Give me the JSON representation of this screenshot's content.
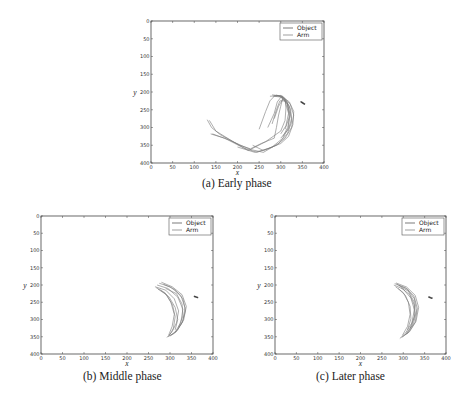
{
  "figure": {
    "panels": [
      {
        "id": "a",
        "caption": "(a) Early phase"
      },
      {
        "id": "b",
        "caption": "(b) Middle phase"
      },
      {
        "id": "c",
        "caption": "(c) Later phase"
      }
    ]
  },
  "colors": {
    "object": "#444444",
    "arm": "#777777",
    "axis": "#444444",
    "background": "#ffffff"
  },
  "chart_data": [
    {
      "type": "line",
      "title": "(a) Early phase",
      "xlabel": "x",
      "ylabel": "y",
      "xlim": [
        0,
        400
      ],
      "ylim": [
        400,
        0
      ],
      "y_inverted": true,
      "xticks": [
        0,
        50,
        100,
        150,
        200,
        250,
        300,
        350,
        400
      ],
      "yticks": [
        0,
        50,
        100,
        150,
        200,
        250,
        300,
        350,
        400
      ],
      "grid": false,
      "legend": {
        "position": "upper right",
        "entries": [
          "Object",
          "Arm"
        ]
      },
      "series": [
        {
          "name": "Object",
          "points": [
            [
              347,
              228
            ],
            [
              352,
              232
            ],
            [
              356,
              235
            ],
            [
              350,
              230
            ]
          ]
        },
        {
          "name": "Arm",
          "trajectories": [
            [
              [
                130,
                278
              ],
              [
                140,
                300
              ],
              [
                160,
                320
              ],
              [
                205,
                350
              ],
              [
                230,
                360
              ],
              [
                255,
                345
              ],
              [
                285,
                330
              ],
              [
                290,
                300
              ],
              [
                295,
                265
              ],
              [
                300,
                240
              ],
              [
                305,
                215
              ],
              [
                295,
                210
              ],
              [
                275,
                212
              ]
            ],
            [
              [
                135,
                280
              ],
              [
                150,
                310
              ],
              [
                190,
                340
              ],
              [
                225,
                365
              ],
              [
                265,
                340
              ],
              [
                300,
                310
              ],
              [
                310,
                280
              ],
              [
                312,
                245
              ],
              [
                310,
                220
              ],
              [
                300,
                210
              ],
              [
                282,
                212
              ]
            ],
            [
              [
                138,
                318
              ],
              [
                170,
                330
              ],
              [
                215,
                358
              ],
              [
                245,
                370
              ],
              [
                280,
                355
              ],
              [
                305,
                330
              ],
              [
                318,
                300
              ],
              [
                320,
                260
              ],
              [
                315,
                230
              ],
              [
                300,
                212
              ],
              [
                285,
                210
              ]
            ],
            [
              [
                142,
                318
              ],
              [
                180,
                335
              ],
              [
                230,
                362
              ],
              [
                260,
                370
              ],
              [
                295,
                345
              ],
              [
                315,
                318
              ],
              [
                325,
                285
              ],
              [
                323,
                250
              ],
              [
                312,
                222
              ],
              [
                290,
                208
              ]
            ],
            [
              [
                200,
                355
              ],
              [
                240,
                370
              ],
              [
                270,
                360
              ],
              [
                300,
                345
              ],
              [
                318,
                325
              ],
              [
                328,
                292
              ],
              [
                330,
                255
              ],
              [
                320,
                228
              ],
              [
                300,
                210
              ]
            ],
            [
              [
                235,
                350
              ],
              [
                260,
                365
              ],
              [
                290,
                350
              ],
              [
                310,
                330
              ],
              [
                325,
                300
              ],
              [
                330,
                265
              ],
              [
                322,
                235
              ],
              [
                305,
                212
              ],
              [
                280,
                208
              ]
            ],
            [
              [
                250,
                305
              ],
              [
                265,
                255
              ],
              [
                275,
                225
              ],
              [
                285,
                212
              ],
              [
                305,
                215
              ],
              [
                320,
                240
              ],
              [
                325,
                275
              ],
              [
                318,
                305
              ],
              [
                300,
                330
              ]
            ],
            [
              [
                270,
                300
              ],
              [
                285,
                260
              ],
              [
                292,
                228
              ],
              [
                300,
                215
              ],
              [
                315,
                230
              ],
              [
                322,
                265
              ],
              [
                316,
                300
              ],
              [
                305,
                325
              ]
            ],
            [
              [
                280,
                290
              ],
              [
                290,
                250
              ],
              [
                298,
                225
              ],
              [
                310,
                225
              ],
              [
                318,
                260
              ],
              [
                312,
                295
              ],
              [
                300,
                318
              ]
            ],
            [
              [
                285,
                275
              ],
              [
                295,
                240
              ],
              [
                305,
                220
              ],
              [
                315,
                235
              ],
              [
                320,
                270
              ],
              [
                310,
                305
              ]
            ]
          ]
        }
      ]
    },
    {
      "type": "line",
      "title": "(b) Middle phase",
      "xlabel": "x",
      "ylabel": "y",
      "xlim": [
        0,
        400
      ],
      "ylim": [
        400,
        0
      ],
      "y_inverted": true,
      "xticks": [
        0,
        50,
        100,
        150,
        200,
        250,
        300,
        350,
        400
      ],
      "yticks": [
        0,
        50,
        100,
        150,
        200,
        250,
        300,
        350,
        400
      ],
      "grid": false,
      "legend": {
        "position": "upper right",
        "entries": [
          "Object",
          "Arm"
        ]
      },
      "series": [
        {
          "name": "Object",
          "points": [
            [
              357,
              233
            ],
            [
              361,
              235
            ],
            [
              364,
              236
            ]
          ]
        },
        {
          "name": "Arm",
          "trajectories": [
            [
              [
                265,
                205
              ],
              [
                290,
                215
              ],
              [
                310,
                240
              ],
              [
                320,
                275
              ],
              [
                315,
                310
              ],
              [
                305,
                335
              ],
              [
                293,
                352
              ]
            ],
            [
              [
                270,
                200
              ],
              [
                295,
                210
              ],
              [
                318,
                235
              ],
              [
                330,
                270
              ],
              [
                325,
                310
              ],
              [
                310,
                340
              ],
              [
                295,
                350
              ]
            ],
            [
              [
                275,
                195
              ],
              [
                300,
                205
              ],
              [
                325,
                230
              ],
              [
                335,
                265
              ],
              [
                330,
                305
              ],
              [
                315,
                335
              ],
              [
                300,
                348
              ]
            ],
            [
              [
                280,
                192
              ],
              [
                305,
                205
              ],
              [
                328,
                228
              ],
              [
                338,
                262
              ],
              [
                332,
                300
              ],
              [
                318,
                330
              ],
              [
                302,
                345
              ]
            ],
            [
              [
                268,
                208
              ],
              [
                288,
                222
              ],
              [
                302,
                250
              ],
              [
                310,
                285
              ],
              [
                305,
                320
              ],
              [
                297,
                345
              ]
            ],
            [
              [
                272,
                212
              ],
              [
                292,
                228
              ],
              [
                306,
                258
              ],
              [
                312,
                292
              ],
              [
                308,
                325
              ],
              [
                298,
                348
              ]
            ],
            [
              [
                285,
                198
              ],
              [
                310,
                212
              ],
              [
                330,
                240
              ],
              [
                336,
                275
              ],
              [
                328,
                310
              ],
              [
                312,
                338
              ]
            ],
            [
              [
                278,
                215
              ],
              [
                298,
                235
              ],
              [
                312,
                265
              ],
              [
                318,
                300
              ],
              [
                312,
                330
              ]
            ],
            [
              [
                290,
                210
              ],
              [
                315,
                225
              ],
              [
                328,
                255
              ],
              [
                330,
                290
              ],
              [
                320,
                322
              ]
            ]
          ]
        }
      ]
    },
    {
      "type": "line",
      "title": "(c) Later phase",
      "xlabel": "x",
      "ylabel": "y",
      "xlim": [
        0,
        400
      ],
      "ylim": [
        400,
        0
      ],
      "y_inverted": true,
      "xticks": [
        0,
        50,
        100,
        150,
        200,
        250,
        300,
        350,
        400
      ],
      "yticks": [
        0,
        50,
        100,
        150,
        200,
        250,
        300,
        350,
        400
      ],
      "grid": false,
      "legend": {
        "position": "upper right",
        "entries": [
          "Object",
          "Arm"
        ]
      },
      "series": [
        {
          "name": "Object",
          "points": [
            [
              360,
              235
            ],
            [
              364,
              237
            ],
            [
              367,
              238
            ]
          ]
        },
        {
          "name": "Arm",
          "trajectories": [
            [
              [
                278,
                200
              ],
              [
                300,
                212
              ],
              [
                318,
                238
              ],
              [
                326,
                272
              ],
              [
                320,
                310
              ],
              [
                305,
                340
              ],
              [
                292,
                355
              ]
            ],
            [
              [
                280,
                196
              ],
              [
                305,
                208
              ],
              [
                325,
                232
              ],
              [
                333,
                268
              ],
              [
                328,
                308
              ],
              [
                312,
                338
              ],
              [
                296,
                352
              ]
            ],
            [
              [
                283,
                194
              ],
              [
                308,
                206
              ],
              [
                328,
                230
              ],
              [
                336,
                265
              ],
              [
                330,
                305
              ],
              [
                315,
                335
              ],
              [
                298,
                350
              ]
            ],
            [
              [
                285,
                198
              ],
              [
                310,
                212
              ],
              [
                326,
                240
              ],
              [
                331,
                275
              ],
              [
                324,
                312
              ],
              [
                308,
                342
              ]
            ],
            [
              [
                282,
                205
              ],
              [
                300,
                222
              ],
              [
                312,
                250
              ],
              [
                316,
                285
              ],
              [
                310,
                320
              ],
              [
                298,
                346
              ]
            ],
            [
              [
                290,
                202
              ],
              [
                312,
                218
              ],
              [
                325,
                248
              ],
              [
                328,
                282
              ],
              [
                320,
                318
              ],
              [
                305,
                344
              ]
            ],
            [
              [
                288,
                210
              ],
              [
                305,
                230
              ],
              [
                316,
                262
              ],
              [
                318,
                298
              ],
              [
                310,
                330
              ]
            ],
            [
              [
                295,
                208
              ],
              [
                315,
                228
              ],
              [
                326,
                258
              ],
              [
                326,
                292
              ],
              [
                316,
                325
              ]
            ]
          ]
        }
      ]
    }
  ]
}
